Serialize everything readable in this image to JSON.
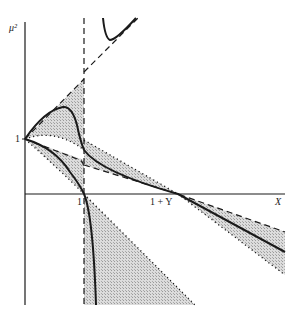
{
  "figure": {
    "type": "phase-diagram",
    "y_axis_label": "μ²",
    "x_axis_label": "X",
    "y_tick_label": "1",
    "x_tick_labels": [
      "1",
      "1 + Y"
    ],
    "colors": {
      "line": "#1a1a1a",
      "shading": "#cfcfcf",
      "background": "#ffffff"
    },
    "elements": [
      "vertical dashed asymptote at X = 1",
      "upper shaded triangular region between X = 0 and X = 1 above μ² = 1",
      "lower shaded wedge converging to X = 1 + Y",
      "shaded region below X-axis right of X = 1",
      "solid curves inside shaded regions",
      "hyperbola-like branch in upper right"
    ]
  }
}
